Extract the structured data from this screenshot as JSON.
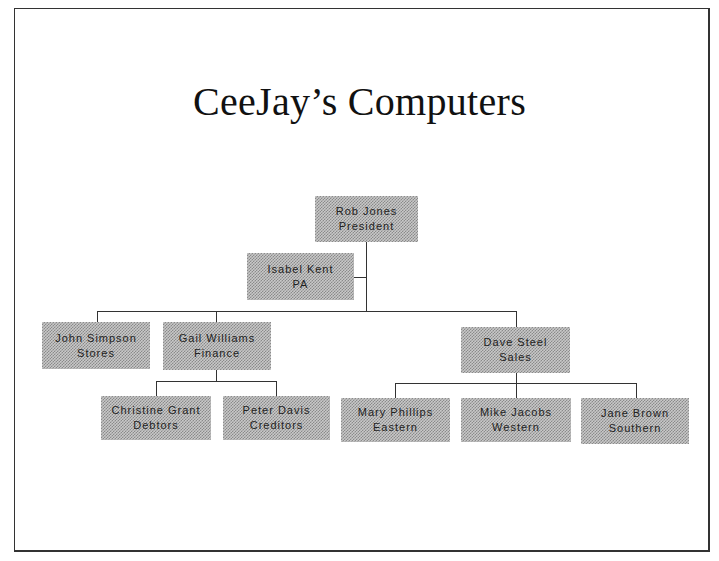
{
  "title": "CeeJay’s Computers",
  "org_chart": {
    "president": {
      "name": "Rob Jones",
      "role": "President"
    },
    "assistant": {
      "name": "Isabel Kent",
      "role": "PA"
    },
    "managers": [
      {
        "name": "John Simpson",
        "role": "Stores"
      },
      {
        "name": "Gail Williams",
        "role": "Finance"
      },
      {
        "name": "Dave Steel",
        "role": "Sales"
      }
    ],
    "finance_staff": [
      {
        "name": "Christine Grant",
        "role": "Debtors"
      },
      {
        "name": "Peter Davis",
        "role": "Creditors"
      }
    ],
    "sales_staff": [
      {
        "name": "Mary Phillips",
        "role": "Eastern"
      },
      {
        "name": "Mike Jacobs",
        "role": "Western"
      },
      {
        "name": "Jane Brown",
        "role": "Southern"
      }
    ]
  },
  "colors": {
    "border": "#333333",
    "box_fill": "#b0b0b0",
    "text": "#222222"
  }
}
